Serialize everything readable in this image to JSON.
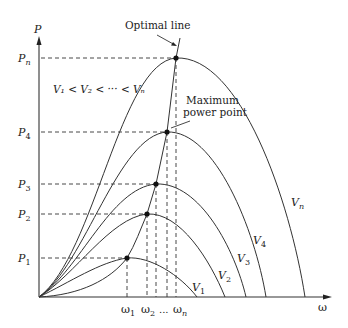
{
  "diagram": {
    "axes": {
      "y_label": "P",
      "x_label": "ω"
    },
    "annotations": {
      "optimal_line": "Optimal line",
      "mpp_line1": "Maximum",
      "mpp_line2": "power point",
      "inequality": "V₁ < V₂ < ··· < Vₙ"
    },
    "power_levels": [
      {
        "label": "P",
        "sub": "1"
      },
      {
        "label": "P",
        "sub": "2"
      },
      {
        "label": "P",
        "sub": "3"
      },
      {
        "label": "P",
        "sub": "4"
      },
      {
        "label": "P",
        "sub": "n"
      }
    ],
    "speed_levels": [
      {
        "label": "ω",
        "sub": "1"
      },
      {
        "label": "ω",
        "sub": "2"
      },
      {
        "label": "...",
        "sub": ""
      },
      {
        "label": "ω",
        "sub": "n"
      }
    ],
    "curves": [
      {
        "label": "V",
        "sub": "1"
      },
      {
        "label": "V",
        "sub": "2"
      },
      {
        "label": "V",
        "sub": "3"
      },
      {
        "label": "V",
        "sub": "4"
      },
      {
        "label": "V",
        "sub": "n"
      }
    ],
    "colors": {
      "stroke": "#333333",
      "background": "#ffffff"
    }
  }
}
